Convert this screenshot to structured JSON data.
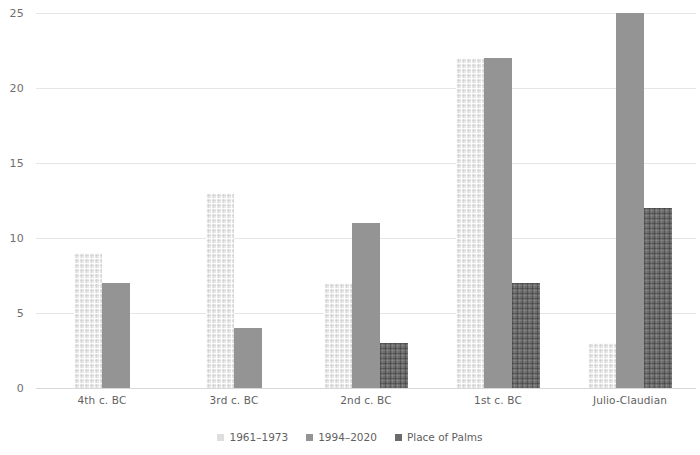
{
  "chart_data": {
    "type": "bar",
    "title": "",
    "subtitle": "",
    "xlabel": "",
    "ylabel": "",
    "ylim": [
      0,
      25
    ],
    "yticks": [
      0,
      5,
      10,
      15,
      20,
      25
    ],
    "grid": true,
    "legend_position": "bottom",
    "categories": [
      "4th c. BC",
      "3rd c. BC",
      "2nd c. BC",
      "1st c. BC",
      "Julio-Claudian"
    ],
    "series": [
      {
        "name": "1961–1973",
        "color": "#e9e9e9",
        "values": [
          9,
          13,
          7,
          22,
          3
        ]
      },
      {
        "name": "1994–2020",
        "color": "#949494",
        "values": [
          7,
          4,
          11,
          22,
          25
        ]
      },
      {
        "name": "Place of Palms",
        "color": "#6b6b6b",
        "values": [
          null,
          null,
          3,
          7,
          12
        ]
      }
    ]
  },
  "axis": {
    "y_tick_labels": [
      "0",
      "5",
      "10",
      "15",
      "20",
      "25"
    ]
  },
  "legend": {
    "items": [
      {
        "label": "1961–1973"
      },
      {
        "label": "1994–2020"
      },
      {
        "label": "Place of Palms"
      }
    ]
  },
  "colors": {
    "series_1961_1973": "#e9e9e9",
    "series_1994_2020": "#949494",
    "series_place_of_palms": "#6b6b6b",
    "gridline": "#e6e6e6",
    "text": "#5f5f5f",
    "background": "#ffffff"
  }
}
